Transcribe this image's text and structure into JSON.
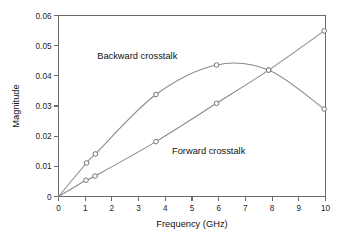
{
  "chart_data": {
    "type": "line",
    "title": "",
    "xlabel": "Frequency (GHz)",
    "ylabel": "Magnitude",
    "xlim": [
      0,
      10
    ],
    "ylim": [
      0,
      0.06
    ],
    "xticks": [
      "0",
      "1",
      "2",
      "3",
      "4",
      "5",
      "6",
      "7",
      "8",
      "9",
      "10"
    ],
    "yticks": [
      "0",
      "0.01",
      "0.02",
      "0.03",
      "0.04",
      "0.05",
      "0.06"
    ],
    "grid": false,
    "legend_position": "inline-annotations",
    "marker": "open-circle",
    "line_color": "#8a8a8a",
    "axis_color": "#6b6b6b",
    "series": [
      {
        "name": "Backward crosstalk",
        "label_x": 1.45,
        "label_y": 0.0455,
        "points": [
          {
            "x": 0.0,
            "y": 0.0
          },
          {
            "x": 1.05,
            "y": 0.0111
          },
          {
            "x": 1.38,
            "y": 0.0141
          },
          {
            "x": 3.65,
            "y": 0.0338
          },
          {
            "x": 5.92,
            "y": 0.0436
          },
          {
            "x": 7.87,
            "y": 0.0419
          },
          {
            "x": 9.95,
            "y": 0.029
          }
        ]
      },
      {
        "name": "Forward crosstalk",
        "label_x": 4.25,
        "label_y": 0.0141,
        "points": [
          {
            "x": 0.0,
            "y": 0.0
          },
          {
            "x": 1.03,
            "y": 0.0054
          },
          {
            "x": 1.37,
            "y": 0.0068
          },
          {
            "x": 3.65,
            "y": 0.0182
          },
          {
            "x": 5.92,
            "y": 0.0309
          },
          {
            "x": 7.87,
            "y": 0.0419
          },
          {
            "x": 9.95,
            "y": 0.0549
          }
        ]
      }
    ]
  }
}
